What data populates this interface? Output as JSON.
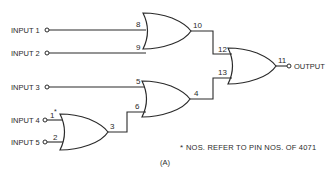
{
  "diagram": {
    "inputs": [
      {
        "label": "INPUT 1",
        "pin": "8"
      },
      {
        "label": "INPUT 2",
        "pin": "9"
      },
      {
        "label": "INPUT 3",
        "pin": "5"
      },
      {
        "label": "INPUT 4",
        "pin": "1*"
      },
      {
        "label": "INPUT 5",
        "pin": "2"
      }
    ],
    "gates": [
      {
        "name": "or-gate-a",
        "inputs": [
          "8",
          "9"
        ],
        "output": "10"
      },
      {
        "name": "or-gate-b",
        "inputs": [
          "5",
          "6"
        ],
        "output": "4"
      },
      {
        "name": "or-gate-c",
        "inputs": [
          "1*",
          "2"
        ],
        "output": "3"
      },
      {
        "name": "or-gate-d",
        "inputs": [
          "12",
          "13"
        ],
        "output": "11"
      }
    ],
    "pins": {
      "p8": "8",
      "p9": "9",
      "p10": "10",
      "p5": "5",
      "p6": "6",
      "p4": "4",
      "p1": "1",
      "p1star": "*",
      "p2": "2",
      "p3": "3",
      "p12": "12",
      "p13": "13",
      "p11": "11"
    },
    "output_label": "OUTPUT",
    "footnote": "NOS. REFER TO PIN NOS. OF 4071",
    "footnote_marker": "*",
    "caption": "(A)"
  }
}
